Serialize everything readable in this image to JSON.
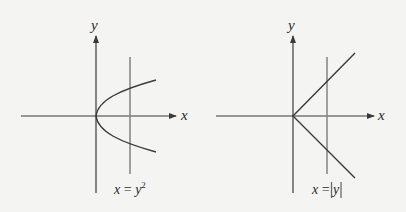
{
  "panels": [
    {
      "id": "left",
      "axis_labels": {
        "x": "x",
        "y": "y"
      },
      "equation": {
        "lhs": "x",
        "op": "=",
        "base": "y",
        "exp": "2",
        "text": "x = y²"
      },
      "curve": "parabola opening right, vertex at origin",
      "vertical_test_line": "vertical line intersecting curve at two points",
      "intersection_markers": 2
    },
    {
      "id": "right",
      "axis_labels": {
        "x": "x",
        "y": "y"
      },
      "equation": {
        "lhs": "x",
        "op": "=",
        "abs_open": "|",
        "var": "y",
        "abs_close": "|",
        "text": "x = |y|"
      },
      "curve": "V shape opening right, vertex at origin",
      "vertical_test_line": "vertical line intersecting curve at two points",
      "intersection_markers": 2
    }
  ],
  "colors": {
    "background": "#f4f4f2",
    "axis": "#3a3a3a",
    "vertical_line": "#8a8a8a",
    "marker": "#6e6e6e"
  }
}
